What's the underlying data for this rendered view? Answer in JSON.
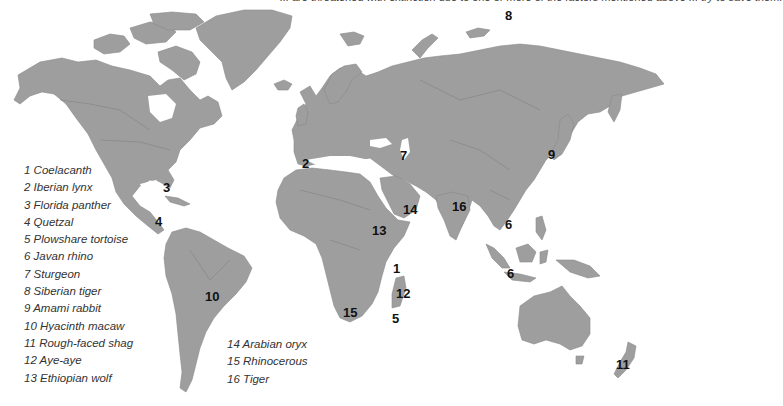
{
  "title_fragment": "... are threatened with extinction due to one or more of the factors mentioned above ... try to save them.",
  "map": {
    "land_color": "#9e9e9e",
    "background_color": "#ffffff",
    "marker_color": "#111111"
  },
  "markers": [
    {
      "num": "1",
      "x": 393,
      "y": 262
    },
    {
      "num": "2",
      "x": 302,
      "y": 157
    },
    {
      "num": "3",
      "x": 163,
      "y": 181
    },
    {
      "num": "4",
      "x": 155,
      "y": 215
    },
    {
      "num": "5",
      "x": 392,
      "y": 312
    },
    {
      "num": "6",
      "x": 505,
      "y": 218
    },
    {
      "num": "6",
      "x": 507,
      "y": 267
    },
    {
      "num": "7",
      "x": 400,
      "y": 149
    },
    {
      "num": "8",
      "x": 505,
      "y": 9
    },
    {
      "num": "9",
      "x": 548,
      "y": 148
    },
    {
      "num": "10",
      "x": 205,
      "y": 290
    },
    {
      "num": "11",
      "x": 616,
      "y": 358
    },
    {
      "num": "12",
      "x": 396,
      "y": 287
    },
    {
      "num": "13",
      "x": 372,
      "y": 224
    },
    {
      "num": "14",
      "x": 403,
      "y": 203
    },
    {
      "num": "15",
      "x": 343,
      "y": 306
    },
    {
      "num": "16",
      "x": 452,
      "y": 200
    }
  ],
  "legend": {
    "column1": [
      "1 Coelacanth",
      "2 Iberian lynx",
      "3 Florida panther",
      "4 Quetzal",
      "5 Plowshare tortoise",
      "6 Javan rhino",
      "7 Sturgeon",
      "8 Siberian tiger",
      "9 Amami rabbit",
      "10 Hyacinth macaw",
      "11 Rough-faced shag",
      "12 Aye-aye",
      "13 Ethiopian wolf"
    ],
    "column2": [
      "14 Arabian oryx",
      "15 Rhinocerous",
      "16 Tiger"
    ]
  }
}
